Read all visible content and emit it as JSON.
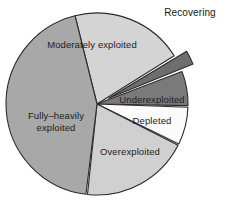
{
  "chart_data": {
    "type": "pie",
    "title": "",
    "subtitle": "",
    "xlabel": "",
    "ylabel": "",
    "legend_position": "none",
    "grid": false,
    "labels_placement": "inside-slices-except-recovering",
    "center": {
      "x": 97,
      "y": 104
    },
    "radius": 91,
    "categories": [
      "Moderately exploited",
      "Recovering",
      "Underexploited",
      "Depleted",
      "Overexploited",
      "Fully–heavily exploited"
    ],
    "values": [
      20,
      2,
      10,
      7,
      20,
      41
    ],
    "slices": [
      {
        "name": "moderately-exploited",
        "label": "Moderately exploited",
        "value": 20,
        "color": "#d4d4d4",
        "start_angle": -104,
        "end_angle": -32,
        "exploded": false,
        "label_x": 92,
        "label_y": 48,
        "label_anchor": "middle",
        "label_lines": [
          "Moderately exploited"
        ]
      },
      {
        "name": "recovering",
        "label": "Recovering",
        "value": 2,
        "color": "#6e6e6e",
        "start_angle": -31,
        "end_angle": -22,
        "exploded": true,
        "explode_offset": 13,
        "label_x": 190,
        "label_y": 16,
        "label_anchor": "middle",
        "label_lines": [
          "Recovering"
        ]
      },
      {
        "name": "underexploited",
        "label": "Underexploited",
        "value": 10,
        "color": "#7a7a7a",
        "start_angle": -21,
        "end_angle": 1,
        "exploded": false,
        "label_x": 152,
        "label_y": 103,
        "label_anchor": "middle",
        "label_lines": [
          "Underexploited"
        ]
      },
      {
        "name": "depleted",
        "label": "Depleted",
        "value": 7,
        "color": "#fbfbfb",
        "start_angle": 2,
        "end_angle": 26,
        "exploded": false,
        "label_x": 152,
        "label_y": 124,
        "label_anchor": "middle",
        "label_lines": [
          "Depleted"
        ]
      },
      {
        "name": "overexploited",
        "label": "Overexploited",
        "value": 20,
        "color": "#d0d0d0",
        "start_angle": 27,
        "end_angle": 96,
        "exploded": false,
        "label_x": 130,
        "label_y": 155,
        "label_anchor": "middle",
        "label_lines": [
          "Overexploited"
        ]
      },
      {
        "name": "fully-heavily-exploited",
        "label": "Fully–heavily exploited",
        "value": 41,
        "color": "#a8a8a8",
        "start_angle": 97,
        "end_angle": 256,
        "exploded": false,
        "label_x": 56,
        "label_y": 119,
        "label_anchor": "middle",
        "label_lines": [
          "Fully–heavily",
          "exploited"
        ]
      }
    ],
    "colors": {
      "moderately_exploited": "#d4d4d4",
      "recovering": "#6e6e6e",
      "underexploited": "#7a7a7a",
      "depleted": "#fbfbfb",
      "overexploited": "#d0d0d0",
      "fully_heavily_exploited": "#a8a8a8",
      "outline": "#2b2b2b",
      "background": "#ffffff",
      "label_text": "#1c1c1c"
    }
  }
}
